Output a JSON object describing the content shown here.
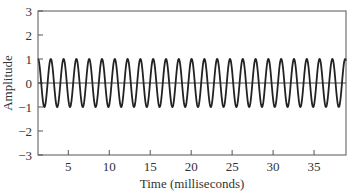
{
  "chart_data": {
    "type": "line",
    "title": "",
    "xlabel": "Time (milliseconds)",
    "ylabel": "Amplitude",
    "xlim": [
      1.3,
      38.9
    ],
    "ylim": [
      -3,
      3
    ],
    "xticks": [
      5,
      10,
      15,
      20,
      25,
      30,
      35
    ],
    "yticks": [
      -3,
      -2,
      -1,
      0,
      1,
      2,
      3
    ],
    "grid": false,
    "legend": null,
    "zero_line": true,
    "series": [
      {
        "name": "sinusoid",
        "function": "cos(2*pi*f*(t - t0))",
        "amplitude": 1,
        "frequency_khz": 0.64,
        "period_ms": 1.5625,
        "t0_ms": 1.3,
        "color": "#222222"
      }
    ]
  }
}
